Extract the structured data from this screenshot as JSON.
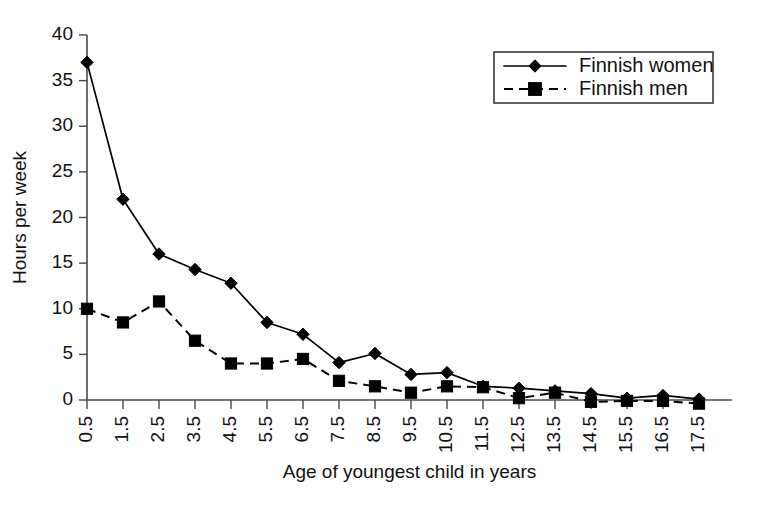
{
  "chart_data": {
    "type": "line",
    "title": "",
    "xlabel": "Age of youngest child in years",
    "ylabel": "Hours per week",
    "categories": [
      "0.5",
      "1.5",
      "2.5",
      "3.5",
      "4.5",
      "5.5",
      "6.5",
      "7.5",
      "8.5",
      "9.5",
      "10.5",
      "11.5",
      "12.5",
      "13.5",
      "14.5",
      "15.5",
      "16.5",
      "17.5"
    ],
    "ylim": [
      0,
      40
    ],
    "yticks": [
      0,
      5,
      10,
      15,
      20,
      25,
      30,
      35,
      40
    ],
    "grid": false,
    "legend_position": "top-right",
    "series": [
      {
        "name": "Finnish women",
        "marker": "diamond",
        "linestyle": "solid",
        "color": "#000000",
        "values": [
          37.0,
          22.0,
          16.0,
          14.3,
          12.8,
          8.5,
          7.2,
          4.1,
          5.1,
          2.8,
          3.0,
          1.5,
          1.3,
          1.0,
          0.7,
          0.2,
          0.5,
          0.1
        ]
      },
      {
        "name": "Finnish men",
        "marker": "square",
        "linestyle": "dashed",
        "color": "#000000",
        "values": [
          10.0,
          8.5,
          10.8,
          6.5,
          4.0,
          4.0,
          4.5,
          2.1,
          1.5,
          0.8,
          1.5,
          1.4,
          0.2,
          0.8,
          -0.2,
          -0.1,
          -0.1,
          -0.4
        ]
      }
    ]
  },
  "legend": {
    "items": [
      {
        "label": "Finnish women",
        "marker": "diamond",
        "linestyle": "solid"
      },
      {
        "label": "Finnish men",
        "marker": "square",
        "linestyle": "dashed"
      }
    ]
  },
  "axes": {
    "y_title": "Hours per week",
    "x_title": "Age of youngest child in years"
  }
}
